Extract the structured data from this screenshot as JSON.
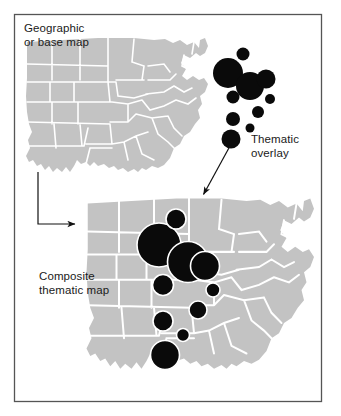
{
  "figure": {
    "canvas": {
      "width": 341,
      "height": 416
    },
    "frame": {
      "x": 14,
      "y": 14,
      "width": 308,
      "height": 388,
      "stroke": "#555555",
      "fill": "#ffffff"
    },
    "colors": {
      "map_fill": "#c3c3c3",
      "map_boundary": "#ffffff",
      "symbol_fill": "#0a0a0a",
      "symbol_outline": "#ffffff",
      "arrow": "#111111",
      "text": "#1a1a1a",
      "page_background": "#ffffff"
    }
  },
  "labels": {
    "geographic": "Geographic\nor base map",
    "thematic": "Thematic\noverlay",
    "composite": "Composite\nthematic map"
  },
  "arrows": [
    {
      "name": "elbow-arrow",
      "type": "elbow",
      "points": [
        [
          38,
          172
        ],
        [
          38,
          224
        ],
        [
          79,
          224
        ]
      ],
      "head_at": [
        79,
        224
      ],
      "direction": "right"
    },
    {
      "name": "diagonal-arrow",
      "type": "straight",
      "from": [
        230,
        146
      ],
      "to": [
        202,
        197
      ],
      "head_at": [
        202,
        197
      ],
      "direction": "down-left"
    }
  ],
  "base_map": {
    "name": "geographic-base-map",
    "x": 24,
    "y": 36,
    "width": 184,
    "height": 140
  },
  "composite_map": {
    "name": "composite-base-map",
    "x": 84,
    "y": 196,
    "width": 230,
    "height": 178
  },
  "thematic_overlay": {
    "name": "thematic-overlay-symbols",
    "description": "Proportional circle symbols, free-floating",
    "symbols": [
      {
        "cx": 228,
        "cy": 73,
        "r": 15.0
      },
      {
        "cx": 243,
        "cy": 54,
        "r": 6.5
      },
      {
        "cx": 250,
        "cy": 86,
        "r": 14.0
      },
      {
        "cx": 266,
        "cy": 79,
        "r": 9.5
      },
      {
        "cx": 233,
        "cy": 97,
        "r": 6.5
      },
      {
        "cx": 270,
        "cy": 99,
        "r": 5.0
      },
      {
        "cx": 258,
        "cy": 112,
        "r": 6.0
      },
      {
        "cx": 233,
        "cy": 119,
        "r": 7.0
      },
      {
        "cx": 250,
        "cy": 128,
        "r": 4.5
      },
      {
        "cx": 231,
        "cy": 139,
        "r": 9.5
      }
    ]
  },
  "composite_symbols": {
    "name": "composite-thematic-symbols",
    "description": "Same proportional circles registered onto the base map",
    "symbols": [
      {
        "cx": 159,
        "cy": 245,
        "r": 22.0
      },
      {
        "cx": 176,
        "cy": 219,
        "r": 10.0
      },
      {
        "cx": 188,
        "cy": 262,
        "r": 20.5
      },
      {
        "cx": 205,
        "cy": 266,
        "r": 14.5
      },
      {
        "cx": 163,
        "cy": 285,
        "r": 10.5
      },
      {
        "cx": 213,
        "cy": 290,
        "r": 7.0
      },
      {
        "cx": 198,
        "cy": 310,
        "r": 9.0
      },
      {
        "cx": 163,
        "cy": 321,
        "r": 10.0
      },
      {
        "cx": 183,
        "cy": 335,
        "r": 6.5
      },
      {
        "cx": 165,
        "cy": 355,
        "r": 14.5
      }
    ]
  }
}
